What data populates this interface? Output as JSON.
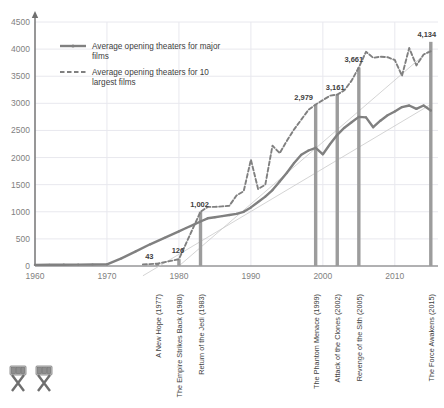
{
  "chart_data": {
    "type": "line",
    "title": "",
    "xlabel": "",
    "ylabel": "",
    "xlim": [
      1960,
      2016
    ],
    "ylim": [
      0,
      4500
    ],
    "grid": true,
    "legend_position": "top-left",
    "yticks": [
      "0",
      "500",
      "1000",
      "1500",
      "2000",
      "2500",
      "3000",
      "3500",
      "4000",
      "4500"
    ],
    "ytick_values": [
      0,
      500,
      1000,
      1500,
      2000,
      2500,
      3000,
      3500,
      4000,
      4500
    ],
    "xticks": [
      "1960",
      "1970",
      "1980",
      "1990",
      "2000",
      "2010"
    ],
    "xtick_values": [
      1960,
      1970,
      1980,
      1990,
      2000,
      2010
    ],
    "series": [
      {
        "name": "Average opening theaters for major films",
        "style": "solid",
        "color": "#808080",
        "x": [
          1960,
          1962,
          1964,
          1966,
          1968,
          1970,
          1972,
          1974,
          1976,
          1978,
          1980,
          1981,
          1982,
          1983,
          1984,
          1985,
          1986,
          1987,
          1988,
          1989,
          1990,
          1991,
          1992,
          1993,
          1994,
          1995,
          1996,
          1997,
          1998,
          1999,
          2000,
          2001,
          2002,
          2003,
          2004,
          2005,
          2006,
          2007,
          2008,
          2009,
          2010,
          2011,
          2012,
          2013,
          2014,
          2015
        ],
        "values": [
          20,
          22,
          24,
          26,
          28,
          30,
          140,
          270,
          400,
          520,
          640,
          700,
          760,
          820,
          880,
          900,
          920,
          940,
          960,
          1000,
          1080,
          1180,
          1280,
          1400,
          1560,
          1720,
          1900,
          2050,
          2130,
          2180,
          2060,
          2250,
          2420,
          2550,
          2650,
          2750,
          2740,
          2560,
          2680,
          2780,
          2850,
          2930,
          2960,
          2900,
          2960,
          2870
        ]
      },
      {
        "name": "Average opening theaters for 10 largest films",
        "style": "dashed",
        "color": "#808080",
        "x": [
          1975,
          1977,
          1980,
          1983,
          1984,
          1985,
          1986,
          1987,
          1988,
          1989,
          1990,
          1991,
          1992,
          1993,
          1994,
          1995,
          1996,
          1997,
          1998,
          1999,
          2000,
          2001,
          2002,
          2003,
          2004,
          2005,
          2006,
          2007,
          2008,
          2009,
          2010,
          2011,
          2012,
          2013,
          2014,
          2015
        ],
        "values": [
          30,
          43,
          126,
          1002,
          1090,
          1090,
          1100,
          1110,
          1300,
          1380,
          1960,
          1420,
          1500,
          2220,
          2080,
          2310,
          2520,
          2700,
          2880,
          2979,
          3060,
          3140,
          3161,
          3240,
          3420,
          3661,
          3950,
          3840,
          3860,
          3850,
          3800,
          3510,
          4020,
          3700,
          3900,
          3960
        ]
      }
    ],
    "trendlines": [
      {
        "name": "trend-major-films",
        "x": [
          1975,
          2015
        ],
        "y": [
          -180,
          2980
        ]
      },
      {
        "name": "trend-10-largest",
        "x": [
          1980,
          2015
        ],
        "y": [
          0,
          4000
        ]
      }
    ],
    "markers": [
      {
        "label": "43",
        "year": 1977,
        "value": 43,
        "film": "A New Hope (1977)"
      },
      {
        "label": "126",
        "year": 1980,
        "value": 126,
        "film": "The Empire Strikes Back (1980)"
      },
      {
        "label": "1,002",
        "year": 1983,
        "value": 1002,
        "film": "Return of the Jedi (1983)"
      },
      {
        "label": "2,979",
        "year": 1999,
        "value": 2979,
        "film": "The Phantom Menace (1999)"
      },
      {
        "label": "3,161",
        "year": 2002,
        "value": 3161,
        "film": "Attack of the Clones (2002)"
      },
      {
        "label": "3,661",
        "year": 2005,
        "value": 3661,
        "film": "Revenge of the Sith (2005)"
      },
      {
        "label": "4,134",
        "year": 2015,
        "value": 4134,
        "film": "The Force Awakens (2015)"
      }
    ],
    "colors": {
      "series": "#808080",
      "marker_bar": "#9c9c9c",
      "gridline": "#e8e8ee",
      "axis": "#6f6f6f",
      "text": "#595959"
    }
  },
  "legend": {
    "items": [
      {
        "label_line1": "Average opening theaters for major",
        "label_line2": "films",
        "style": "solid"
      },
      {
        "label_line1": "Average opening theaters for 10",
        "label_line2": "largest films",
        "style": "dashed"
      }
    ]
  },
  "footer": {
    "logo_name": "film-chair-logo"
  }
}
